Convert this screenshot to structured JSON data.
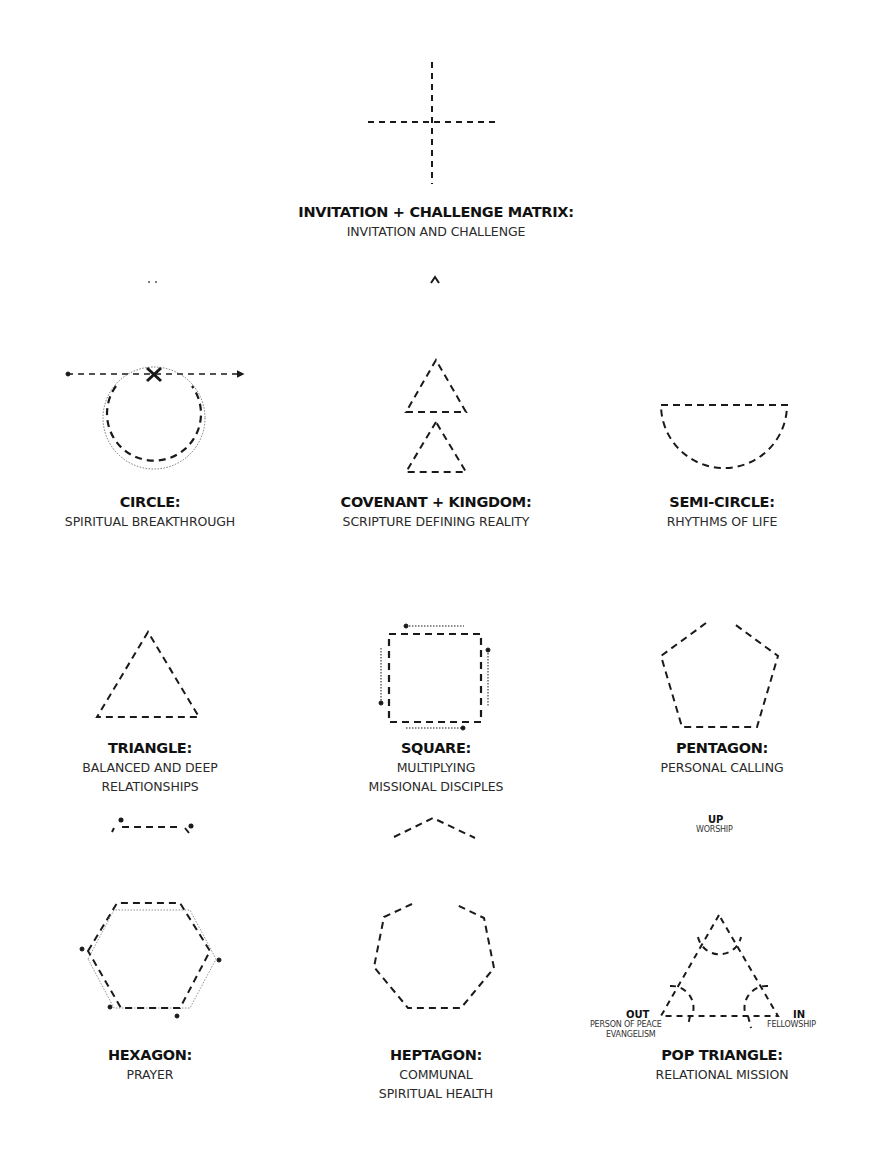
{
  "diagram": {
    "stroke_color": "#1a1a1a",
    "background": "#ffffff",
    "shapes": [
      {
        "id": "matrix",
        "title": "INVITATION + CHALLENGE MATRIX:",
        "subtitle_lines": [
          "INVITATION AND CHALLENGE"
        ],
        "icon": "dashed-cross"
      },
      {
        "id": "circle",
        "title": "CIRCLE:",
        "subtitle_lines": [
          "SPIRITUAL BREAKTHROUGH"
        ],
        "icon": "dashed-circle-with-arrow-line-and-x"
      },
      {
        "id": "covenant",
        "title": "COVENANT + KINGDOM:",
        "subtitle_lines": [
          "SCRIPTURE DEFINING REALITY"
        ],
        "icon": "two-stacked-dashed-triangles"
      },
      {
        "id": "semicircle",
        "title": "SEMI-CIRCLE:",
        "subtitle_lines": [
          "RHYTHMS OF LIFE"
        ],
        "icon": "dashed-semicircle"
      },
      {
        "id": "triangle",
        "title": "TRIANGLE:",
        "subtitle_lines": [
          "BALANCED AND DEEP",
          "RELATIONSHIPS"
        ],
        "icon": "dashed-triangle"
      },
      {
        "id": "square",
        "title": "SQUARE:",
        "subtitle_lines": [
          "MULTIPLYING",
          "MISSIONAL DISCIPLES"
        ],
        "icon": "dashed-square-with-arrows"
      },
      {
        "id": "pentagon",
        "title": "PENTAGON:",
        "subtitle_lines": [
          "PERSONAL CALLING"
        ],
        "icon": "dashed-pentagon-open-top"
      },
      {
        "id": "hexagon",
        "title": "HEXAGON:",
        "subtitle_lines": [
          "PRAYER"
        ],
        "icon": "dashed-hexagon-with-dotted-outline"
      },
      {
        "id": "heptagon",
        "title": "HEPTAGON:",
        "subtitle_lines": [
          "COMMUNAL",
          "SPIRITUAL HEALTH"
        ],
        "icon": "dashed-heptagon-open-top"
      },
      {
        "id": "pop",
        "title": "POP TRIANGLE:",
        "subtitle_lines": [
          "RELATIONAL MISSION"
        ],
        "icon": "dashed-triangle-with-corner-arcs"
      }
    ],
    "pop_triangle_labels": {
      "up_title": "UP",
      "up_sub": "WORSHIP",
      "out_title": "OUT",
      "out_sub_1": "PERSON OF PEACE",
      "out_sub_2": "EVANGELISM",
      "in_title": "IN",
      "in_sub": "FELLOWSHIP"
    }
  }
}
